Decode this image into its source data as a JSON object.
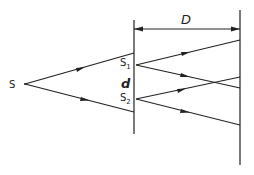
{
  "diagram": {
    "labels": {
      "source": "S",
      "slit1_main": "S",
      "slit1_sub": "1",
      "slit2_main": "S",
      "slit2_sub": "2",
      "slit_separation": "d",
      "screen_distance": "D"
    },
    "elements": {
      "source_point": {
        "x": 25,
        "y": 84
      },
      "barrier": {
        "x": 134,
        "y1": 20,
        "y2": 134
      },
      "screen": {
        "x": 240,
        "y1": 10,
        "y2": 165
      },
      "slit1": {
        "x": 136,
        "y": 65
      },
      "slit2": {
        "x": 136,
        "y": 99
      },
      "dimension_line": {
        "x1": 134,
        "x2": 240,
        "y": 29
      }
    },
    "rays": [
      {
        "from": "S",
        "to": [
          134,
          53
        ]
      },
      {
        "from": "S",
        "to": [
          134,
          112
        ]
      },
      {
        "from": "S1",
        "to": [
          240,
          40
        ]
      },
      {
        "from": "S1",
        "to": [
          240,
          88
        ]
      },
      {
        "from": "S2",
        "to": [
          240,
          77
        ]
      },
      {
        "from": "S2",
        "to": [
          240,
          125
        ]
      }
    ],
    "colors": {
      "line": "#222222",
      "background": "#ffffff"
    }
  }
}
